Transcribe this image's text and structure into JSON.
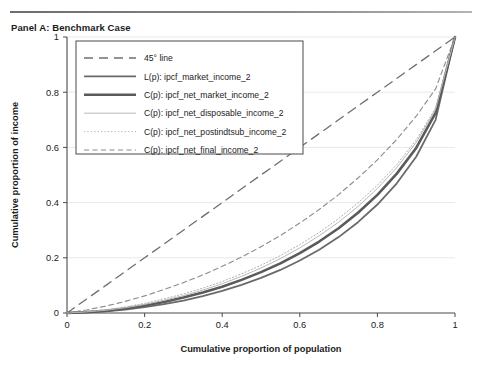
{
  "panel": {
    "title": "Panel A: Benchmark Case"
  },
  "chart_data": {
    "type": "line",
    "title": "Panel A: Benchmark Case",
    "xlabel": "Cumulative proportion of population",
    "ylabel": "Cumulative proportion of income",
    "xlim": [
      0,
      1
    ],
    "ylim": [
      0,
      1
    ],
    "xticks": [
      "0",
      "0.2",
      "0.4",
      "0.6",
      "0.8",
      "1"
    ],
    "yticks": [
      "0",
      "0.2",
      "0.4",
      "0.6",
      "0.8",
      "1"
    ],
    "xtick_values": [
      0,
      0.2,
      0.4,
      0.6,
      0.8,
      1
    ],
    "ytick_values": [
      0,
      0.2,
      0.4,
      0.6,
      0.8,
      1
    ],
    "grid": true,
    "grid_axis": "y",
    "legend_position": "upper left",
    "x": [
      0,
      0.05,
      0.1,
      0.15,
      0.2,
      0.25,
      0.3,
      0.35,
      0.4,
      0.45,
      0.5,
      0.55,
      0.6,
      0.65,
      0.7,
      0.75,
      0.8,
      0.85,
      0.9,
      0.95,
      1
    ],
    "series": [
      {
        "name": "45° line",
        "label": "45° line",
        "style": "dashed-long",
        "color": "#6f6f6f",
        "width": 1.3,
        "values": [
          0,
          0.05,
          0.1,
          0.15,
          0.2,
          0.25,
          0.3,
          0.35,
          0.4,
          0.45,
          0.5,
          0.55,
          0.6,
          0.65,
          0.7,
          0.75,
          0.8,
          0.85,
          0.9,
          0.95,
          1
        ]
      },
      {
        "name": "L(p): ipcf_market_income_2",
        "label": "L(p): ipcf_market_income_2",
        "style": "solid",
        "color": "#6a6a6a",
        "width": 1.8,
        "values": [
          0,
          0.002,
          0.006,
          0.012,
          0.021,
          0.032,
          0.045,
          0.061,
          0.08,
          0.102,
          0.127,
          0.156,
          0.19,
          0.229,
          0.275,
          0.329,
          0.393,
          0.47,
          0.566,
          0.7,
          1
        ]
      },
      {
        "name": "C(p): ipcf_net_market_income_2",
        "label": "C(p): ipcf_net_market_income_2",
        "style": "solid",
        "color": "#5a5a5a",
        "width": 2.6,
        "values": [
          0,
          0.003,
          0.008,
          0.016,
          0.027,
          0.04,
          0.056,
          0.074,
          0.095,
          0.12,
          0.148,
          0.18,
          0.217,
          0.259,
          0.307,
          0.363,
          0.428,
          0.505,
          0.598,
          0.725,
          1
        ]
      },
      {
        "name": "C(p): ipcf_net_disposable_income_2",
        "label": "C(p): ipcf_net_disposable_income_2",
        "style": "solid",
        "color": "#b9b9b9",
        "width": 1.0,
        "values": [
          0,
          0.004,
          0.01,
          0.019,
          0.031,
          0.046,
          0.063,
          0.083,
          0.106,
          0.133,
          0.163,
          0.197,
          0.236,
          0.28,
          0.329,
          0.386,
          0.451,
          0.527,
          0.618,
          0.738,
          1
        ]
      },
      {
        "name": "C(p): ipcf_net_postindtsub_income_2",
        "label": "C(p): ipcf_net_postindtsub_income_2",
        "style": "dotted",
        "color": "#b0b0b0",
        "width": 1.0,
        "values": [
          0,
          0.005,
          0.012,
          0.022,
          0.035,
          0.051,
          0.069,
          0.09,
          0.114,
          0.142,
          0.173,
          0.208,
          0.248,
          0.292,
          0.342,
          0.399,
          0.463,
          0.538,
          0.627,
          0.743,
          1
        ]
      },
      {
        "name": "C(p): ipcf_net_final_income_2",
        "label": "C(p): ipcf_net_final_income_2",
        "style": "dashed-short",
        "color": "#8c8c8c",
        "width": 1.1,
        "values": [
          0,
          0.011,
          0.025,
          0.042,
          0.062,
          0.085,
          0.11,
          0.138,
          0.169,
          0.203,
          0.24,
          0.281,
          0.326,
          0.375,
          0.429,
          0.489,
          0.555,
          0.629,
          0.713,
          0.812,
          1
        ]
      }
    ]
  }
}
